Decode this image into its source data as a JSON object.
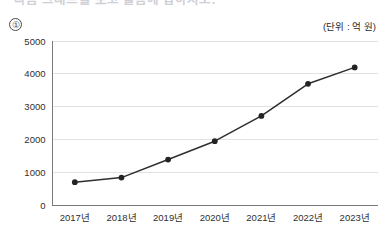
{
  "figure": {
    "title": "다음 그래프를 보고 물음에 답하시오.",
    "item_number": "①",
    "unit_label": "(단위 : 억 원)",
    "background_color": "#ffffff"
  },
  "chart_data": {
    "type": "line",
    "title": "",
    "xlabel": "",
    "ylabel": "",
    "unit": "억 원",
    "categories": [
      "2017년",
      "2018년",
      "2019년",
      "2020년",
      "2021년",
      "2022년",
      "2023년"
    ],
    "values": [
      680,
      820,
      1370,
      1930,
      2700,
      3680,
      4180
    ],
    "series": [
      {
        "name": "",
        "values": [
          680,
          820,
          1370,
          1930,
          2700,
          3680,
          4180
        ]
      }
    ],
    "ylim": [
      0,
      5000
    ],
    "ytick_labels": [
      "0",
      "1000",
      "2000",
      "3000",
      "4000",
      "5000"
    ],
    "ytick_values": [
      0,
      1000,
      2000,
      3000,
      4000,
      5000
    ],
    "grid": true,
    "grid_axis": "y",
    "legend": false,
    "legend_position": "none",
    "marker": "circle",
    "line_color": "#2e2e30",
    "marker_color": "#232325",
    "grid_color": "#e2e2e4",
    "axis_color": "#7a7a7a"
  }
}
